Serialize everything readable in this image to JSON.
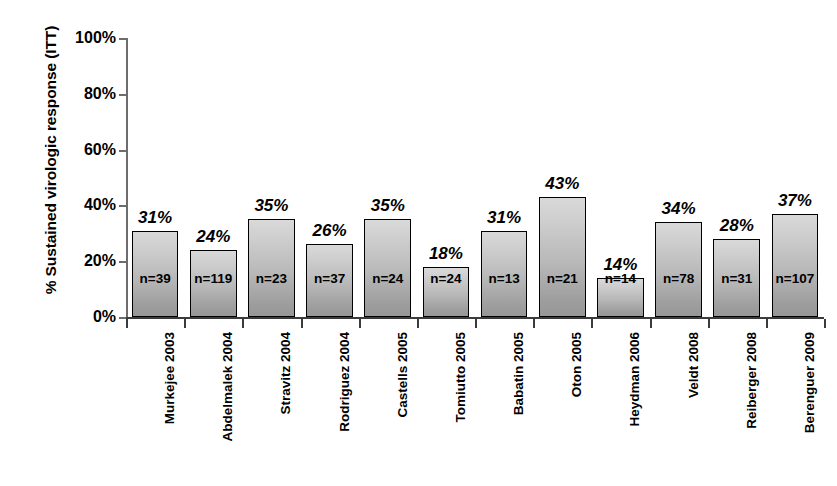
{
  "chart_data": {
    "type": "bar",
    "title": "",
    "xlabel": "",
    "ylabel": "% Sustained virologic response (ITT)",
    "ylim": [
      0,
      100
    ],
    "ytick_labels": [
      "100%",
      "80%",
      "60%",
      "40%",
      "20%",
      "0%"
    ],
    "ytick_values": [
      100,
      80,
      60,
      40,
      20,
      0
    ],
    "grid": false,
    "legend": null,
    "categories": [
      "Murkejee 2003",
      "Abdelmalek 2004",
      "Stravitz 2004",
      "Rodriguez 2004",
      "Castells 2005",
      "Tomiutto 2005",
      "Babatin 2005",
      "Oton 2005",
      "Heydman 2006",
      "Veldt 2008",
      "Reiberger 2008",
      "Berenguer 2009"
    ],
    "values": [
      31,
      24,
      35,
      26,
      35,
      18,
      31,
      43,
      14,
      34,
      28,
      37
    ],
    "value_labels": [
      "31%",
      "24%",
      "35%",
      "26%",
      "35%",
      "18%",
      "31%",
      "43%",
      "14%",
      "34%",
      "28%",
      "37%"
    ],
    "n_labels": [
      "n=39",
      "n=119",
      "n=23",
      "n=37",
      "n=24",
      "n=24",
      "n=13",
      "n=21",
      "n=14",
      "n=78",
      "n=31",
      "n=107"
    ],
    "n_values": [
      39,
      119,
      23,
      37,
      24,
      24,
      13,
      21,
      14,
      78,
      31,
      107
    ],
    "bar_fill_top_color": "#d9d9d9",
    "bar_fill_bottom_color": "#979797",
    "bar_border_color": "#000000",
    "axis_color": "#3b3b3b"
  }
}
